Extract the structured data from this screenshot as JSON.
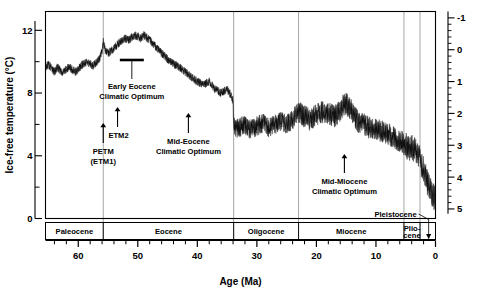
{
  "chart_data": {
    "type": "area",
    "title": "",
    "xlabel": "Age (Ma)",
    "ylabel_left": "Ice-free temperature (°C)",
    "ylabel_right": "",
    "xlim": [
      65.5,
      0
    ],
    "x_reversed": true,
    "ylim_left": [
      0,
      13.2
    ],
    "ylim_right": [
      5.3,
      -1.2
    ],
    "y_right_inverted": true,
    "grid": "vertical-only",
    "legend": "none",
    "left_ticks_major": [
      0,
      4,
      8,
      12
    ],
    "left_ticks_minor": [
      2,
      6,
      10
    ],
    "right_ticks_major": [
      -1,
      0,
      1,
      2,
      3,
      4,
      5
    ],
    "right_minor_step": 0.2,
    "x_ticks_major": [
      60,
      50,
      40,
      30,
      20,
      10,
      0
    ],
    "x_ticks_minor_step": 2,
    "gridlines_at": [
      55.8,
      33.9,
      23.0,
      5.3,
      2.6
    ],
    "series": [
      {
        "name": "Deep-sea benthic foraminiferal δ¹⁸O",
        "units": "per mil",
        "x": [
          65.5,
          65.0,
          64.5,
          64.0,
          63.5,
          63.0,
          62.5,
          62.0,
          61.5,
          61.0,
          60.5,
          60.0,
          59.5,
          59.0,
          58.5,
          58.0,
          57.5,
          57.0,
          56.5,
          56.0,
          55.8,
          55.5,
          55.0,
          54.5,
          54.0,
          53.5,
          53.0,
          52.5,
          52.0,
          51.5,
          51.0,
          50.5,
          50.0,
          49.5,
          49.0,
          48.5,
          48.0,
          47.5,
          47.0,
          46.5,
          46.0,
          45.0,
          44.0,
          43.0,
          42.0,
          41.0,
          40.0,
          39.0,
          38.0,
          37.0,
          36.0,
          35.0,
          34.5,
          34.0,
          33.9,
          33.5,
          33.0,
          32.0,
          31.0,
          30.0,
          29.0,
          28.0,
          27.0,
          26.0,
          25.0,
          24.0,
          23.5,
          23.0,
          22.0,
          21.0,
          20.0,
          19.0,
          18.0,
          17.0,
          16.0,
          15.5,
          15.0,
          14.5,
          14.0,
          13.5,
          13.0,
          12.0,
          11.0,
          10.0,
          9.0,
          8.0,
          7.0,
          6.0,
          5.3,
          5.0,
          4.5,
          4.0,
          3.5,
          3.0,
          2.6,
          2.4,
          2.0,
          1.5,
          1.0,
          0.5,
          0.0
        ],
        "values_d18o": [
          0.55,
          0.45,
          0.6,
          0.7,
          0.55,
          0.65,
          0.72,
          0.6,
          0.55,
          0.62,
          0.7,
          0.62,
          0.5,
          0.42,
          0.38,
          0.45,
          0.5,
          0.42,
          0.3,
          0.05,
          -0.25,
          0.0,
          0.1,
          0.05,
          -0.05,
          -0.15,
          -0.25,
          -0.3,
          -0.35,
          -0.3,
          -0.4,
          -0.45,
          -0.42,
          -0.35,
          -0.45,
          -0.38,
          -0.3,
          -0.2,
          -0.1,
          0.0,
          0.1,
          0.3,
          0.45,
          0.55,
          0.7,
          0.85,
          1.0,
          1.1,
          1.0,
          1.25,
          1.35,
          1.25,
          1.4,
          1.6,
          2.3,
          2.5,
          2.45,
          2.35,
          2.5,
          2.4,
          2.3,
          2.45,
          2.35,
          2.25,
          2.35,
          2.2,
          2.05,
          1.95,
          2.1,
          2.2,
          2.05,
          1.95,
          2.0,
          2.1,
          1.95,
          1.75,
          1.7,
          1.8,
          1.95,
          2.1,
          2.25,
          2.35,
          2.45,
          2.5,
          2.55,
          2.65,
          2.75,
          2.85,
          2.95,
          3.0,
          3.1,
          3.05,
          3.15,
          3.25,
          3.4,
          3.6,
          3.7,
          4.1,
          4.35,
          4.55,
          4.7,
          4.85
        ],
        "values_temp_c": [
          9.0,
          9.4,
          8.8,
          8.4,
          9.0,
          8.6,
          8.3,
          8.8,
          9.0,
          8.7,
          8.4,
          8.7,
          9.2,
          9.5,
          9.7,
          9.4,
          9.2,
          9.5,
          10.0,
          11.0,
          12.2,
          11.1,
          10.7,
          10.9,
          11.3,
          11.7,
          12.1,
          12.3,
          12.5,
          12.3,
          12.7,
          12.9,
          12.8,
          12.5,
          12.9,
          12.6,
          12.3,
          11.9,
          11.5,
          11.1,
          10.7,
          9.9,
          9.3,
          8.9,
          8.3,
          7.8,
          7.4,
          7.0,
          7.4,
          6.5,
          6.1,
          6.5,
          6.0,
          5.3,
          2.7,
          2.0,
          2.2,
          2.6,
          2.0,
          2.4,
          2.8,
          2.2,
          2.6,
          3.0,
          2.6,
          3.2,
          3.8,
          4.2,
          3.6,
          3.2,
          3.8,
          4.2,
          3.8,
          3.4,
          4.2,
          4.4,
          4.0,
          3.4,
          2.8,
          2.2,
          1.8,
          1.4,
          1.2,
          1.0,
          0.6,
          0.2,
          -0.2,
          -0.6,
          -0.8,
          -1.2,
          -1.0,
          -1.4,
          -1.8,
          -2.3,
          -2.7,
          -4.3,
          -5.3,
          -6.1,
          -6.7,
          -7.2
        ]
      }
    ],
    "annotations": [
      {
        "label": "PETM\n(ETM1)",
        "line1": "PETM",
        "line2": "(ETM1)",
        "x_ma": 55.8,
        "marker": "up-arrow"
      },
      {
        "label": "ETM2",
        "line1": "ETM2",
        "line2": "",
        "x_ma": 53.7,
        "marker": "up-arrow"
      },
      {
        "label": "Early Eocene Climatic Optimum",
        "line1": "Early Eocene",
        "line2": "Climatic Optimum",
        "x_ma": 51.0,
        "marker": "horizontal-bar"
      },
      {
        "label": "Mid-Eocene Climatic Optimum",
        "line1": "Mid-Eocene",
        "line2": "Climatic Optimum",
        "x_ma": 41.5,
        "marker": "up-arrow"
      },
      {
        "label": "Mid-Miocene Climatic Optimum",
        "line1": "Mid-Miocene",
        "line2": "Climatic Optimum",
        "x_ma": 15.5,
        "marker": "up-arrow"
      }
    ],
    "epochs": [
      {
        "name": "Paleocene",
        "start_ma": 65.5,
        "end_ma": 55.8,
        "label": "Paleocene"
      },
      {
        "name": "Eocene",
        "start_ma": 55.8,
        "end_ma": 33.9,
        "label": "Eocene"
      },
      {
        "name": "Oligocene",
        "start_ma": 33.9,
        "end_ma": 23.0,
        "label": "Oligocene"
      },
      {
        "name": "Miocene",
        "start_ma": 23.0,
        "end_ma": 5.3,
        "label": "Miocene"
      },
      {
        "name": "Pliocene",
        "start_ma": 5.3,
        "end_ma": 2.6,
        "label_line1": "Plio-",
        "label_line2": "cene"
      },
      {
        "name": "Pleistocene",
        "start_ma": 2.6,
        "end_ma": 0.0,
        "label": "Pleistocene",
        "label_placement": "outside-leader"
      }
    ]
  },
  "axes": {
    "left_title": "Ice-free temperature (°C)",
    "bottom_title": "Age (Ma)"
  },
  "labels": {
    "t0": "0",
    "t4": "4",
    "t8": "8",
    "t12": "12",
    "r_neg1": "-1",
    "r0": "0",
    "r1": "1",
    "r2": "2",
    "r3": "3",
    "r4": "4",
    "r5": "5",
    "x60": "60",
    "x50": "50",
    "x40": "40",
    "x30": "30",
    "x20": "20",
    "x10": "10",
    "x0": "0",
    "paleocene": "Paleocene",
    "eocene": "Eocene",
    "oligocene": "Oligocene",
    "miocene": "Miocene",
    "plio1": "Plio-",
    "plio2": "cene",
    "pleistocene": "Pleistocene",
    "petm1": "PETM",
    "petm2": "(ETM1)",
    "etm2": "ETM2",
    "eeco1": "Early Eocene",
    "eeco2": "Climatic Optimum",
    "meco1": "Mid-Eocene",
    "meco2": "Climatic Optimum",
    "mmco1": "Mid-Miocene",
    "mmco2": "Climatic Optimum"
  },
  "colors": {
    "curve": "#111111",
    "gridline": "#8f8f8f",
    "axis": "#000000",
    "background": "#ffffff"
  }
}
